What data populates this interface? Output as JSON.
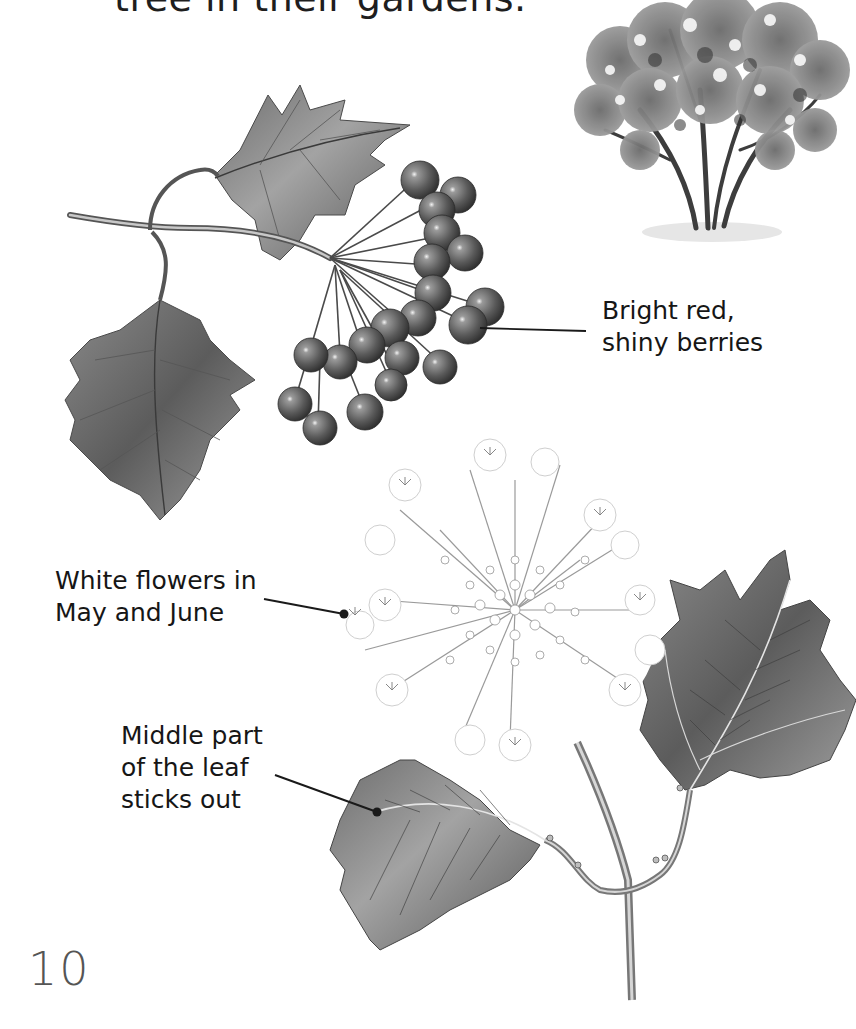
{
  "page": {
    "heading_fragment": "tree in their gardens.",
    "page_number": "10"
  },
  "labels": {
    "berries": {
      "line1": "Bright red,",
      "line2": "shiny berries"
    },
    "flowers": {
      "line1": "White flowers in",
      "line2": "May and June"
    },
    "leaf": {
      "line1": "Middle part",
      "line2": "of the leaf",
      "line3": "sticks out"
    }
  },
  "illustrations": {
    "tree": "guelder-rose-shrub",
    "berry_branch": "berry-cluster-with-leaves",
    "flower_branch": "flower-head-with-leaves"
  },
  "colors": {
    "text": "#161616",
    "leader_line": "#1a1a1a",
    "page_number": "#555555",
    "illustration_dark": "#3a3a3a",
    "illustration_mid": "#7a7a7a",
    "illustration_light": "#bdbdbd"
  }
}
